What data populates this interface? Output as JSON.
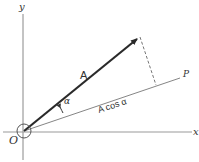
{
  "diagram": {
    "type": "vector-projection",
    "labels": {
      "y_axis": "y",
      "x_axis": "x",
      "origin": "O",
      "vector": "A",
      "angle": "α",
      "projection": "A cos α",
      "line": "P"
    },
    "colors": {
      "axes": "#888888",
      "vector": "#2a2a2a",
      "line": "#666666",
      "dashed": "#666666",
      "text": "#333333"
    }
  }
}
